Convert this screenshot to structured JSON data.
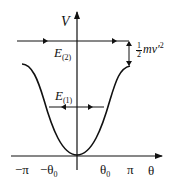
{
  "diagram": {
    "y_axis_label": "V",
    "x_axis_label": "θ",
    "x_ticks": [
      "−π",
      "−θ",
      "θ",
      "π"
    ],
    "x_tick_subscripts": [
      "",
      "0",
      "0",
      ""
    ],
    "energy_levels": [
      {
        "name": "E",
        "sub": "(2)"
      },
      {
        "name": "E",
        "sub": "(1)"
      }
    ],
    "kinetic_label": {
      "num": "1",
      "den": "2",
      "text": "mv′",
      "sup": "2"
    },
    "colors": {
      "stroke": "#111111",
      "background": "#ffffff"
    }
  }
}
